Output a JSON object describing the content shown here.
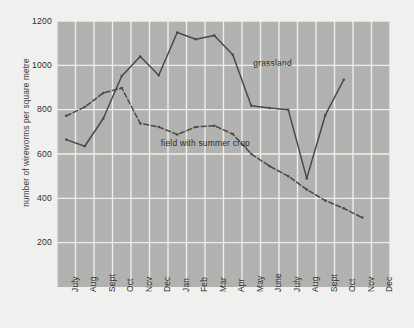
{
  "chart_data": {
    "type": "line",
    "title": "",
    "subtitle": "",
    "xlabel": "",
    "ylabel": "number of wireworms per square metre",
    "categories": [
      "July",
      "Aug",
      "Sept",
      "Oct",
      "Nov",
      "Dec",
      "Jan",
      "Feb",
      "Mar",
      "Apr",
      "May",
      "June",
      "July",
      "Aug",
      "Sept",
      "Oct",
      "Nov",
      "Dec"
    ],
    "ylim": [
      0,
      1200
    ],
    "yticks": [
      200,
      400,
      600,
      800,
      1000,
      1200
    ],
    "ytick_labels": [
      "200",
      "400",
      "600",
      "800",
      "1000",
      "1200"
    ],
    "grid": true,
    "legend_position": "inline-annotation",
    "series": [
      {
        "name": "grassland",
        "style": "solid",
        "color": "#4a4a48",
        "marker": "dot",
        "label_text": "grassland",
        "values": [
          665,
          635,
          760,
          952,
          1040,
          955,
          1148,
          1118,
          1135,
          1048,
          818,
          808,
          800,
          490,
          775,
          935,
          null,
          null
        ]
      },
      {
        "name": "field with summer crop",
        "style": "dashed",
        "color": "#4a4a48",
        "marker": "dot",
        "label_text": "field with summer crop",
        "values": [
          772,
          812,
          875,
          898,
          738,
          722,
          688,
          722,
          728,
          690,
          600,
          545,
          500,
          440,
          390,
          355,
          313,
          null
        ]
      }
    ],
    "annotations": [
      {
        "text": "grassland",
        "x_category": "May",
        "y_value": 1005
      },
      {
        "text": "field with summer crop",
        "x_category": "Dec",
        "y_value": 645
      }
    ],
    "plot_background": "#b3b3b1",
    "gridline_color": "#f0f0ee",
    "page_background": "#f2f2f0"
  },
  "axis": {
    "y_title": "number of wireworms per square metre"
  }
}
